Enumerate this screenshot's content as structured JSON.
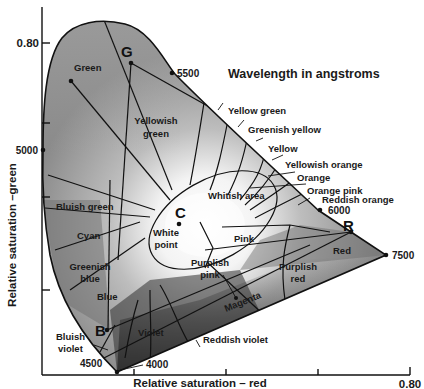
{
  "figure": {
    "legend_title": "Wavelength in angstroms",
    "axes": {
      "x_label": "Relative saturation – red",
      "y_label": "Relative saturation –green",
      "x_max_tick": "0.80",
      "y_max_tick": "0.80"
    },
    "wavelength_marks": [
      "4000",
      "4500",
      "5000",
      "5500",
      "6000",
      "7500"
    ],
    "primary_points": {
      "G": "G",
      "R": "R",
      "B": "B",
      "C": "C"
    },
    "regions": {
      "green": "Green",
      "yellowish_green_1": "Yellowish",
      "yellowish_green_2": "green",
      "yellow_green": "Yellow green",
      "greenish_yellow": "Greenish yellow",
      "yellow": "Yellow",
      "yellowish_orange": "Yellowish orange",
      "orange": "Orange",
      "orange_pink": "Orange pink",
      "reddish_orange": "Reddish orange",
      "whitish_area": "Whitish area",
      "white_point_1": "White",
      "white_point_2": "point",
      "pink": "Pink",
      "red": "Red",
      "purplish_red_1": "Purplish",
      "purplish_red_2": "red",
      "purplish_pink_1": "Purplish",
      "purplish_pink_2": "pink",
      "magenta": "Magenta",
      "reddish_violet": "Reddish violet",
      "violet": "Violet",
      "bluish_violet_1": "Bluish",
      "bluish_violet_2": "violet",
      "blue": "Blue",
      "greenish_blue_1": "Greenish",
      "greenish_blue_2": "blue",
      "cyan": "Cyan",
      "bluish_green": "Bluish green"
    },
    "colors": {
      "locus_light": "#e8e8e8",
      "locus_mid": "#a0a0a0",
      "locus_dark": "#3a3a3a",
      "ink": "#111111",
      "background": "#ffffff"
    }
  }
}
